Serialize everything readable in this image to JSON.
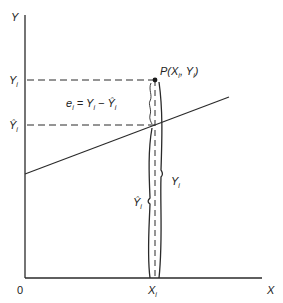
{
  "diagram": {
    "type": "regression-residual-illustration",
    "axes": {
      "y_label": "Y",
      "x_label": "X",
      "origin_label": "0"
    },
    "y_ticks": {
      "observed": {
        "main": "Y",
        "sub": "i"
      },
      "fitted": {
        "main": "Ŷ",
        "sub": "i"
      }
    },
    "x_tick": {
      "main": "X",
      "sub": "i"
    },
    "residual_formula": {
      "e": "e",
      "e_sub": "i",
      "eq": " = ",
      "y": "Y",
      "y_sub": "i",
      "minus": " − ",
      "yhat": "Ŷ",
      "yhat_sub": "i"
    },
    "point_label": {
      "name": "P",
      "open": "(",
      "x": "X",
      "x_sub": "i",
      "comma": ", ",
      "y": "Y",
      "y_sub": "i",
      "close": ")"
    },
    "brace_labels": {
      "observed": {
        "main": "Y",
        "sub": "i"
      },
      "fitted": {
        "main": "Ŷ",
        "sub": "i"
      }
    },
    "colors": {
      "ink": "#2a2a2a",
      "background": "#ffffff"
    }
  }
}
